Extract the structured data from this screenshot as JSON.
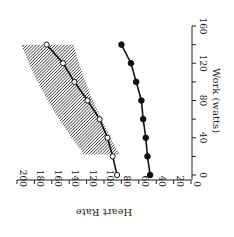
{
  "chart_data": {
    "type": "line",
    "orientation": "rotated-90",
    "title": "",
    "xlabel": "Work (watts)",
    "ylabel": "Heart Rate",
    "x_ticks": [
      0,
      40,
      80,
      120,
      160
    ],
    "y_ticks": [
      0,
      20,
      40,
      60,
      80,
      100,
      120,
      140,
      160,
      180,
      200
    ],
    "xlim": [
      0,
      160
    ],
    "ylim": [
      0,
      200
    ],
    "x": [
      0,
      20,
      40,
      60,
      80,
      100,
      120,
      140
    ],
    "series": [
      {
        "name": "open-circles",
        "marker": "open-circle",
        "values": [
          85,
          90,
          96,
          105,
          119,
          134,
          147,
          166
        ]
      },
      {
        "name": "filled-circles",
        "marker": "filled-circle",
        "values": [
          47,
          50,
          52,
          55,
          57,
          63,
          69,
          80
        ]
      }
    ],
    "shaded_band": {
      "x": [
        22,
        140
      ],
      "lower": [
        82,
        135
      ],
      "upper": [
        123,
        195
      ],
      "style": "hatched"
    },
    "grid": false,
    "legend": "none"
  },
  "labels": {
    "xlabel": "Work (watts)",
    "ylabel": "Heart Rate",
    "x_tick_labels": [
      "0",
      "40",
      "80",
      "120",
      "160"
    ],
    "y_tick_labels": [
      "0",
      "20",
      "40",
      "60",
      "80",
      "100",
      "120",
      "140",
      "160",
      "180",
      "200"
    ]
  }
}
